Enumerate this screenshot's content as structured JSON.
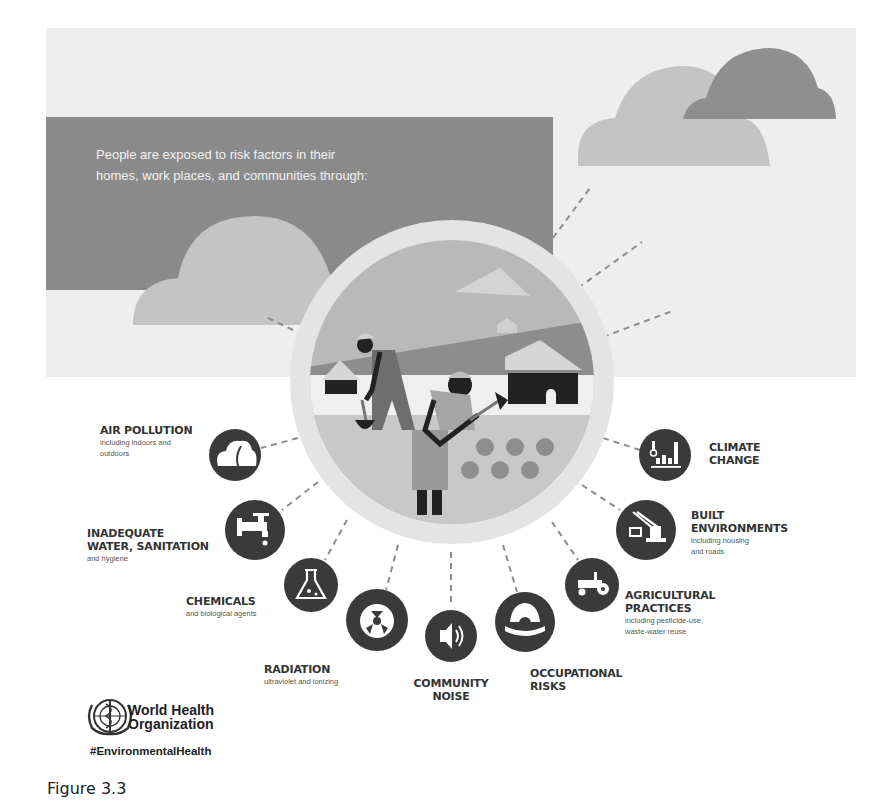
{
  "intro": {
    "text_line1": "People are exposed to risk factors in their",
    "text_line2": "homes, work places, and communities through:"
  },
  "risk_factors": [
    {
      "id": "air-pollution",
      "title_lines": [
        "AIR POLLUTION"
      ],
      "subtitle_lines": [
        "including indoors and",
        "outdoors"
      ],
      "icon": "cloud-smoke-icon"
    },
    {
      "id": "water-sanitation",
      "title_lines": [
        "INADEQUATE",
        "WATER, SANITATION"
      ],
      "subtitle_lines": [
        "and hygiene"
      ],
      "icon": "water-tap-icon"
    },
    {
      "id": "chemicals",
      "title_lines": [
        "CHEMICALS"
      ],
      "subtitle_lines": [
        "and biological agents"
      ],
      "icon": "flask-icon"
    },
    {
      "id": "radiation",
      "title_lines": [
        "RADIATION"
      ],
      "subtitle_lines": [
        "ultraviolet and ionizing"
      ],
      "icon": "radiation-icon"
    },
    {
      "id": "community-noise",
      "title_lines": [
        "COMMUNITY",
        "NOISE"
      ],
      "subtitle_lines": [],
      "icon": "speaker-icon"
    },
    {
      "id": "occupational-risks",
      "title_lines": [
        "OCCUPATIONAL",
        "RISKS"
      ],
      "subtitle_lines": [],
      "icon": "hard-hat-icon"
    },
    {
      "id": "agricultural-practices",
      "title_lines": [
        "AGRICULTURAL",
        "PRACTICES"
      ],
      "subtitle_lines": [
        "including pesticide-use,",
        "waste-water reuse"
      ],
      "icon": "tractor-icon"
    },
    {
      "id": "built-environments",
      "title_lines": [
        "BUILT",
        "ENVIRONMENTS"
      ],
      "subtitle_lines": [
        "including housing",
        "and roads"
      ],
      "icon": "crane-icon"
    },
    {
      "id": "climate-change",
      "title_lines": [
        "CLIMATE",
        "CHANGE"
      ],
      "subtitle_lines": [],
      "icon": "thermometer-chart-icon"
    }
  ],
  "logo": {
    "org_line1": "World Health",
    "org_line2": "Organization",
    "hashtag": "#EnvironmentalHealth"
  },
  "caption": "Figure 3.3",
  "colors": {
    "icon_fill": "#3a3a3a",
    "intro_box": "#8a8a8a",
    "panel": "#eeeeee",
    "cloud_light": "#c4c4c4",
    "cloud_dark": "#8f8f8f",
    "ring": "#e2e2e2",
    "dash": "#8c8c8c"
  }
}
